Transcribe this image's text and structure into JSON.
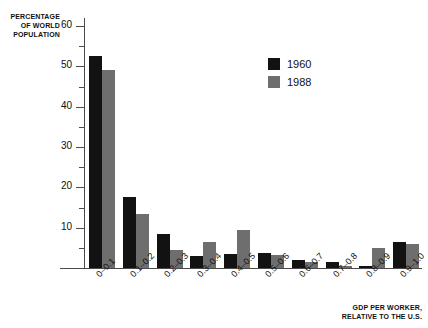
{
  "chart_data": {
    "type": "bar",
    "title": "",
    "subtitle": "",
    "ylabel": "PERCENTAGE\nOF WORLD\nPOPULATION",
    "xlabel": "GDP PER WORKER,\nRELATIVE TO THE U.S.",
    "categories": [
      "0–0.1",
      "0.1–0.2",
      "0.2–0.3",
      "0.3–0.4",
      "0.4–0.5",
      "0.5–0.6",
      "0.6–0.7",
      "0.7–0.8",
      "0.8–0.9",
      "0.9–1.0"
    ],
    "series": [
      {
        "name": "1960",
        "color": "#121212",
        "values": [
          52.5,
          17.5,
          8.5,
          3.0,
          3.5,
          3.8,
          2.0,
          1.5,
          0.4,
          6.5
        ]
      },
      {
        "name": "1988",
        "color": "#6e6e6e",
        "values": [
          49.0,
          13.5,
          4.5,
          6.5,
          9.5,
          3.2,
          1.5,
          0.5,
          5.0,
          6.0
        ]
      }
    ],
    "ylim": [
      0,
      62
    ],
    "yticks_major": [
      10,
      20,
      30,
      40,
      50,
      60
    ],
    "yticks_minor": [
      5,
      15,
      25,
      35,
      45,
      55
    ],
    "grid": false,
    "legend_position": "top-right",
    "legend": [
      {
        "label": "1960",
        "color": "#121212"
      },
      {
        "label": "1988",
        "color": "#6e6e6e"
      }
    ]
  }
}
